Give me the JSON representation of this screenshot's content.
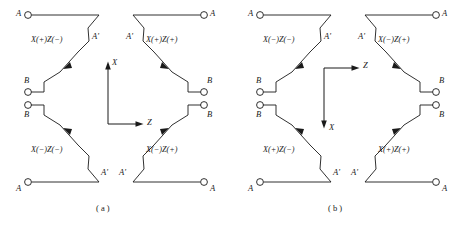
{
  "figure": {
    "domain_note": "technical line diagram of crystal cut orientations",
    "panels": [
      {
        "id": "a",
        "caption": "( a )",
        "axes": {
          "vertical_label": "X",
          "vertical_direction": "up",
          "horizontal_label": "Z",
          "horizontal_direction": "right",
          "corner": "bottom-left"
        },
        "quadrants": [
          {
            "position": "top-left",
            "label": "X(+)Z(−)"
          },
          {
            "position": "top-right",
            "label": "X(+)Z(+)"
          },
          {
            "position": "bottom-left",
            "label": "X(−)Z(−)"
          },
          {
            "position": "bottom-right",
            "label": "X(−)Z(+)"
          }
        ],
        "terminals": [
          {
            "name": "A",
            "position": "top-left"
          },
          {
            "name": "A'",
            "position": "top-left-inner"
          },
          {
            "name": "A",
            "position": "top-right"
          },
          {
            "name": "A'",
            "position": "top-right-inner"
          },
          {
            "name": "B",
            "position": "middle-left-upper"
          },
          {
            "name": "B",
            "position": "middle-right-upper"
          },
          {
            "name": "B",
            "position": "middle-left-lower"
          },
          {
            "name": "B",
            "position": "middle-right-lower"
          },
          {
            "name": "A",
            "position": "bottom-left"
          },
          {
            "name": "A'",
            "position": "bottom-left-inner"
          },
          {
            "name": "A",
            "position": "bottom-right"
          },
          {
            "name": "A'",
            "position": "bottom-right-inner"
          }
        ]
      },
      {
        "id": "b",
        "caption": "( b )",
        "axes": {
          "vertical_label": "X",
          "vertical_direction": "down",
          "horizontal_label": "Z",
          "horizontal_direction": "right",
          "corner": "top-left"
        },
        "quadrants": [
          {
            "position": "top-left",
            "label": "X(−)Z(−)"
          },
          {
            "position": "top-right",
            "label": "X(−)Z(+)"
          },
          {
            "position": "bottom-left",
            "label": "X(+)Z(−)"
          },
          {
            "position": "bottom-right",
            "label": "X(+)Z(+)"
          }
        ],
        "terminals": [
          {
            "name": "A",
            "position": "top-left"
          },
          {
            "name": "A'",
            "position": "top-left-inner"
          },
          {
            "name": "A",
            "position": "top-right"
          },
          {
            "name": "A'",
            "position": "top-right-inner"
          },
          {
            "name": "B",
            "position": "middle-left-upper"
          },
          {
            "name": "B",
            "position": "middle-right-upper"
          },
          {
            "name": "B",
            "position": "middle-left-lower"
          },
          {
            "name": "B",
            "position": "middle-right-lower"
          },
          {
            "name": "A",
            "position": "bottom-left"
          },
          {
            "name": "A'",
            "position": "bottom-left-inner"
          },
          {
            "name": "A",
            "position": "bottom-right"
          },
          {
            "name": "A'",
            "position": "bottom-right-inner"
          }
        ]
      }
    ],
    "colors": {
      "line": "#1a1a1a",
      "background": "#ffffff",
      "text": "#1a1a1a"
    }
  }
}
